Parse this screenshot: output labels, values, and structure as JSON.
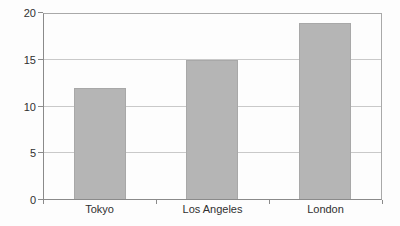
{
  "chart_data": {
    "type": "bar",
    "title": "",
    "xlabel": "",
    "ylabel": "",
    "categories": [
      "Tokyo",
      "Los Angeles",
      "London"
    ],
    "values": [
      12,
      15,
      19
    ],
    "series": [
      {
        "name": "",
        "values": [
          12,
          15,
          19
        ]
      }
    ],
    "ylim": [
      0,
      20
    ],
    "yticks": [
      0,
      5,
      10,
      15,
      20
    ],
    "grid": "horizontal",
    "legend": "none",
    "colors": {
      "bar": "#b5b5b5",
      "bar_edge": "#a8a8a8",
      "gridline": "#c9c9c9",
      "axis": "#8a8a8a",
      "frame": "#a9a9a9",
      "text": "#303030",
      "background": "#fdfdfd"
    }
  }
}
